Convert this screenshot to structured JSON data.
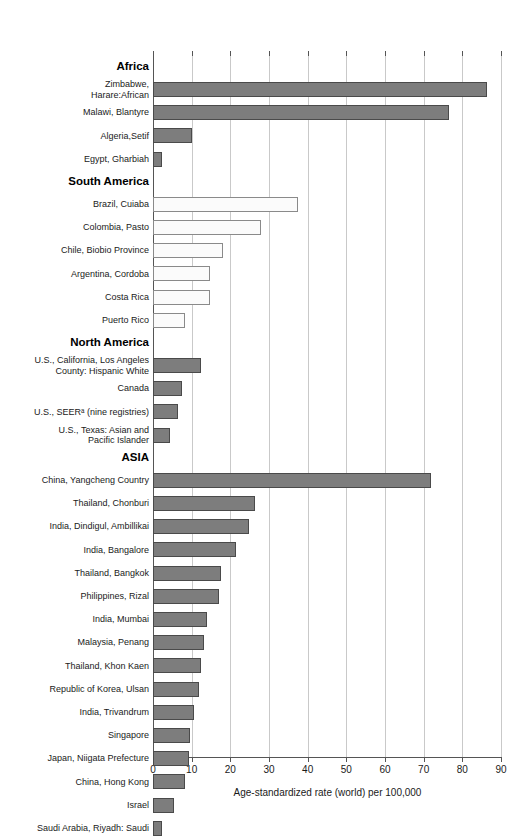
{
  "chart_data": {
    "type": "bar",
    "orientation": "horizontal",
    "title": "",
    "xlabel": "Age-standardized rate (world) per 100,000",
    "ylabel": "",
    "xlim": [
      0,
      90
    ],
    "xticks": [
      0,
      10,
      20,
      30,
      40,
      50,
      60,
      70,
      80,
      90
    ],
    "xticklabels": [
      "0",
      "10",
      "20",
      "30",
      "40",
      "50",
      "60",
      "70",
      "80",
      "90"
    ],
    "grid": "vertical",
    "legend": "none",
    "footnote_marker": "a",
    "sections": [
      {
        "name": "Africa",
        "style": "filled",
        "items": [
          {
            "label": "Zimbabwe,\nHarare:African",
            "value": 86.3
          },
          {
            "label": "Malawi, Blantyre",
            "value": 76.5
          },
          {
            "label": "Algeria,Setif",
            "value": 10.0
          },
          {
            "label": "Egypt, Gharbiah",
            "value": 2.3
          }
        ]
      },
      {
        "name": "South America",
        "style": "hollow",
        "items": [
          {
            "label": "Brazil, Cuiaba",
            "value": 37.5
          },
          {
            "label": "Colombia, Pasto",
            "value": 28.0
          },
          {
            "label": "Chile, Biobio Province",
            "value": 18.0
          },
          {
            "label": "Argentina, Cordoba",
            "value": 14.8
          },
          {
            "label": "Costa Rica",
            "value": 14.8
          },
          {
            "label": "Puerto Rico",
            "value": 8.3
          }
        ]
      },
      {
        "name": "North America",
        "style": "filled",
        "items": [
          {
            "label": "U.S., California, Los Angeles\nCounty: Hispanic White",
            "value": 12.5
          },
          {
            "label": "Canada",
            "value": 7.4
          },
          {
            "label": "U.S., SEERᵃ (nine registries)",
            "value": 6.5
          },
          {
            "label": "U.S., Texas: Asian and\nPacific Islander",
            "value": 4.4
          }
        ]
      },
      {
        "name": "ASIA",
        "style": "filled",
        "items": [
          {
            "label": "China, Yangcheng Country",
            "value": 72.0
          },
          {
            "label": "Thailand, Chonburi",
            "value": 26.4
          },
          {
            "label": "India, Dindigul, Ambillikai",
            "value": 24.8
          },
          {
            "label": "India, Bangalore",
            "value": 21.4
          },
          {
            "label": "Thailand, Bangkok",
            "value": 17.6
          },
          {
            "label": "Philippines, Rizal",
            "value": 17.0
          },
          {
            "label": "India, Mumbai",
            "value": 13.9
          },
          {
            "label": "Malaysia, Penang",
            "value": 13.2
          },
          {
            "label": "Thailand, Khon Kaen",
            "value": 12.4
          },
          {
            "label": "Republic of Korea, Ulsan",
            "value": 11.8
          },
          {
            "label": "India, Trivandrum",
            "value": 10.6
          },
          {
            "label": "Singapore",
            "value": 9.6
          },
          {
            "label": "Japan, Niigata Prefecture",
            "value": 9.2
          },
          {
            "label": "China, Hong Kong",
            "value": 8.2
          },
          {
            "label": "Israel",
            "value": 5.5
          },
          {
            "label": "Saudi Arabia, Riyadh: Saudi",
            "value": 2.4
          }
        ]
      }
    ]
  },
  "colors": {
    "bar_filled": "#7d7d7d",
    "bar_filled_border": "#4a4a4a",
    "bar_hollow": "#fbfbfb",
    "bar_hollow_border": "#8a8a8a",
    "gridline": "#c9c9c9",
    "axis": "#555555",
    "text": "#1a1a1a",
    "background": "#ffffff"
  }
}
